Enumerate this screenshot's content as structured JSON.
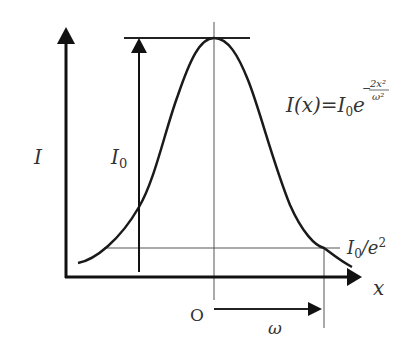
{
  "diagram": {
    "type": "gaussian-profile",
    "labels": {
      "y_axis": "I",
      "x_axis": "x",
      "peak_intensity": "I",
      "peak_intensity_sub": "0",
      "threshold": "I",
      "threshold_sub": "0",
      "threshold_tail": "/e",
      "threshold_sup": "2",
      "origin": "O",
      "beam_radius": "ω"
    },
    "formula": {
      "lhs": "I(x)",
      "equals": "=",
      "coef": "I",
      "coef_sub": "0",
      "base": "e",
      "exp_sign": "−",
      "exp_num": "2x²",
      "exp_den": "ω²"
    },
    "colors": {
      "axis": "#111111",
      "curve": "#1a1a1a",
      "guide": "#555555",
      "text": "#333333"
    }
  }
}
